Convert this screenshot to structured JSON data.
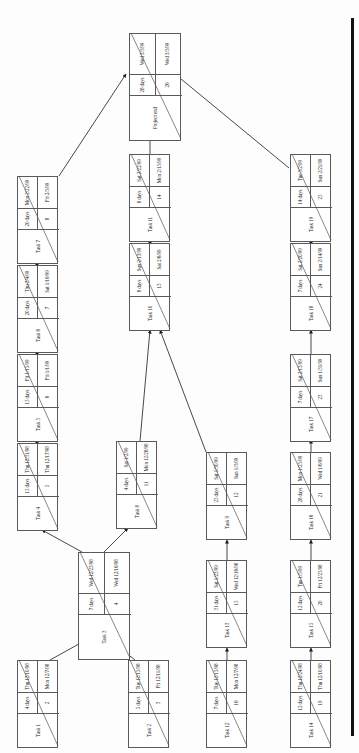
{
  "diagram": {
    "type": "pert-network-diagram",
    "orientation": "rotated-90-ccw",
    "columns_header": "",
    "page_edge_label": ""
  },
  "nodes": [
    {
      "key": "n26",
      "name": "Project end",
      "id": "26",
      "duration": "28 days",
      "start": "Wed 3/3/99",
      "finish": "Wed 3/3/99",
      "x": 129,
      "y": 33,
      "w": 43,
      "h": 84,
      "wide": true
    },
    {
      "key": "n8",
      "name": "Task 7",
      "id": "8",
      "duration": "20 days",
      "start": "Fri 2/5/99",
      "finish": "Mon 2/22/99",
      "x": 17,
      "y": 176,
      "w": 41,
      "h": 84,
      "wide": false
    },
    {
      "key": "n7",
      "name": "Task 6",
      "id": "7",
      "duration": "20 days",
      "start": "Sat 1/16/99",
      "finish": "Thu 2/4/99",
      "x": 17,
      "y": 265,
      "w": 41,
      "h": 84,
      "wide": false
    },
    {
      "key": "n6",
      "name": "Task 5",
      "id": "6",
      "duration": "15 days",
      "start": "Fri 1/1/99",
      "finish": "Fri 1/15/99",
      "x": 17,
      "y": 354,
      "w": 41,
      "h": 84,
      "wide": false
    },
    {
      "key": "n5",
      "name": "Task 4",
      "id": "5",
      "duration": "15 days",
      "start": "Thu 12/17/98",
      "finish": "Thu 12/31/98",
      "x": 17,
      "y": 443,
      "w": 41,
      "h": 84,
      "wide": false
    },
    {
      "key": "n4",
      "name": "Task 3",
      "id": "4",
      "duration": "7 days",
      "start": "Wed 12/16/98",
      "finish": "Wed 12/23/98",
      "x": 78,
      "y": 552,
      "w": 52,
      "h": 84,
      "wide": true
    },
    {
      "key": "n2",
      "name": "Task 1",
      "id": "2",
      "duration": "4 days",
      "start": "Mon 12/7/98",
      "finish": "Thu 12/10/98",
      "x": 17,
      "y": 660,
      "w": 41,
      "h": 84,
      "wide": false
    },
    {
      "key": "n3",
      "name": "Task 2",
      "id": "3",
      "duration": "5 days",
      "start": "Fri 12/11/98",
      "finish": "Tue 12/15/98",
      "x": 128,
      "y": 660,
      "w": 41,
      "h": 84,
      "wide": false
    },
    {
      "key": "n14",
      "name": "Task 11",
      "id": "14",
      "duration": "8 days",
      "start": "Mon 2/15/99",
      "finish": "Sat 2/22/99",
      "x": 129,
      "y": 154,
      "w": 41,
      "h": 84,
      "wide": false
    },
    {
      "key": "n13",
      "name": "Task 10",
      "id": "13",
      "duration": "8 days",
      "start": "Sat 2/6/99",
      "finish": "Sun 2/13/99",
      "x": 129,
      "y": 243,
      "w": 41,
      "h": 84,
      "wide": false
    },
    {
      "key": "n11",
      "name": "Task 8",
      "id": "11",
      "duration": "4 days",
      "start": "Mon 12/28/98",
      "finish": "Sat 1/2/99",
      "x": 116,
      "y": 441,
      "w": 41,
      "h": 84,
      "wide": false
    },
    {
      "key": "n12",
      "name": "Task 9",
      "id": "12",
      "duration": "25 days",
      "start": "Sun 1/3/99",
      "finish": "Sat 1/30/99",
      "x": 206,
      "y": 452,
      "w": 41,
      "h": 84,
      "wide": false
    },
    {
      "key": "n15",
      "name": "Task 13",
      "id": "15",
      "duration": "31 days",
      "start": "Wed 12/16/98",
      "finish": "Sat 1/23/99",
      "x": 206,
      "y": 560,
      "w": 41,
      "h": 84,
      "wide": false
    },
    {
      "key": "n16",
      "name": "Task 12",
      "id": "16",
      "duration": "7 days",
      "start": "Mon 12/7/98",
      "finish": "Tue 12/15/98",
      "x": 206,
      "y": 660,
      "w": 41,
      "h": 84,
      "wide": false
    },
    {
      "key": "n25",
      "name": "Task 19",
      "id": "25",
      "duration": "14 days",
      "start": "Sun 2/21/99",
      "finish": "Tue 3/2/99",
      "x": 290,
      "y": 154,
      "w": 41,
      "h": 84,
      "wide": false
    },
    {
      "key": "n24",
      "name": "Task 18",
      "id": "24",
      "duration": "7 days",
      "start": "Sun 2/14/99",
      "finish": "Sat 2/20/99",
      "x": 290,
      "y": 243,
      "w": 41,
      "h": 84,
      "wide": false
    },
    {
      "key": "n23",
      "name": "Task 17",
      "id": "23",
      "duration": "7 days",
      "start": "Sun 1/31/99",
      "finish": "Sat 2/13/99",
      "x": 290,
      "y": 354,
      "w": 41,
      "h": 84,
      "wide": false
    },
    {
      "key": "n21",
      "name": "Task 16",
      "id": "21",
      "duration": "28 days",
      "start": "Wed 1/6/99",
      "finish": "Mon 1/25/99",
      "x": 290,
      "y": 452,
      "w": 41,
      "h": 84,
      "wide": false
    },
    {
      "key": "n20",
      "name": "Task 15",
      "id": "20",
      "duration": "12 days",
      "start": "Fri 12/25/98",
      "finish": "Tue 1/5/99",
      "x": 290,
      "y": 560,
      "w": 41,
      "h": 84,
      "wide": false
    },
    {
      "key": "n19",
      "name": "Task 14",
      "id": "19",
      "duration": "12 days",
      "start": "Thu 12/10/98",
      "finish": "Thu 12/24/98",
      "x": 290,
      "y": 660,
      "w": 41,
      "h": 84,
      "wide": false
    }
  ],
  "links": [
    {
      "from": "n8",
      "to": "n26",
      "d": "M 59,176 L 126,74"
    },
    {
      "from": "n14",
      "to": "n26",
      "d": "M 150,154 L 150,120"
    },
    {
      "from": "n25",
      "to": "n26",
      "d": "M 289,168 L 175,74"
    },
    {
      "from": "n13",
      "to": "n14",
      "d": "M 150,243 L 150,240"
    },
    {
      "from": "n11",
      "to": "n13",
      "d": "M 140,441 L 150,330"
    },
    {
      "from": "n12",
      "to": "n13",
      "d": "M 206,452 L 160,330"
    },
    {
      "from": "n7",
      "to": "n8",
      "d": "M 37,265 L 37,262"
    },
    {
      "from": "n6",
      "to": "n7",
      "d": "M 37,354 L 37,351"
    },
    {
      "from": "n5",
      "to": "n6",
      "d": "M 37,443 L 37,440"
    },
    {
      "from": "n4",
      "to": "n5",
      "d": "M 82,552 L 42,530"
    },
    {
      "from": "n4",
      "to": "n11",
      "d": "M 104,552 L 128,528"
    },
    {
      "from": "n2",
      "to": "n4",
      "d": "M 50,660 L 86,640"
    },
    {
      "from": "n3",
      "to": "n4",
      "d": "M 135,660 L 110,640"
    },
    {
      "from": "n16",
      "to": "n15",
      "d": "M 227,660 L 227,648"
    },
    {
      "from": "n15",
      "to": "n12",
      "d": "M 227,560 L 227,540"
    },
    {
      "from": "n19",
      "to": "n20",
      "d": "M 311,660 L 311,648"
    },
    {
      "from": "n20",
      "to": "n21",
      "d": "M 311,560 L 311,540"
    },
    {
      "from": "n21",
      "to": "n23",
      "d": "M 311,452 L 311,440"
    },
    {
      "from": "n23",
      "to": "n24",
      "d": "M 311,354 L 311,330"
    },
    {
      "from": "n24",
      "to": "n25",
      "d": "M 311,243 L 311,240"
    }
  ]
}
